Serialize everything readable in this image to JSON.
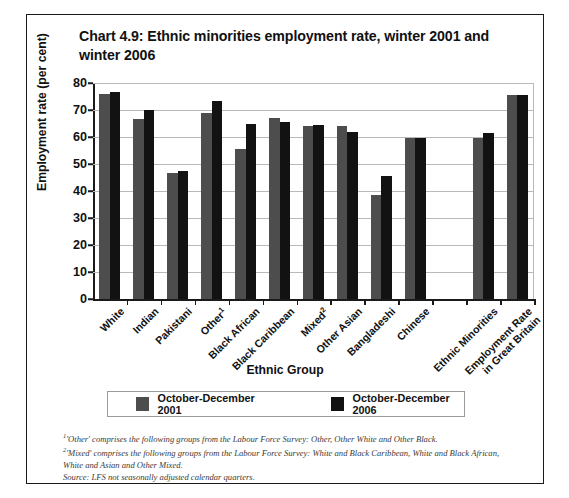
{
  "chart_data": {
    "type": "bar",
    "title": "Chart 4.9: Ethnic minorities employment rate, winter 2001 and winter 2006",
    "xlabel": "Ethnic Group",
    "ylabel": "Employment rate (per cent)",
    "ylim": [
      0,
      80
    ],
    "yticks": [
      0,
      10,
      20,
      30,
      40,
      50,
      60,
      70,
      80
    ],
    "ytick_labels": [
      "0",
      "10",
      "20",
      "30",
      "40",
      "50",
      "60",
      "70",
      "80"
    ],
    "grid": "horizontal",
    "legend_position": "below-plot",
    "categories": [
      "White",
      "Indian",
      "Pakistani",
      "Other¹",
      "Black African",
      "Black Caribbean",
      "Mixed²",
      "Other Asian",
      "Bangladeshi",
      "Chinese",
      "",
      "Ethnic Minorities",
      "Employment Rate in Great Britain"
    ],
    "series": [
      {
        "name": "October-December 2001",
        "color": "#4d4d4d",
        "values": [
          76.0,
          66.5,
          46.5,
          69.0,
          55.5,
          67.0,
          64.0,
          64.0,
          38.5,
          59.5,
          null,
          59.5,
          75.5
        ]
      },
      {
        "name": "October-December 2006",
        "color": "#121212",
        "values": [
          76.5,
          70.0,
          47.5,
          73.5,
          65.0,
          65.5,
          64.5,
          62.0,
          45.5,
          59.5,
          null,
          61.5,
          75.5
        ]
      }
    ]
  },
  "title": {
    "line1": "Chart 4.9: Ethnic minorities employment rate, winter 2001",
    "line2": "and winter 2006"
  },
  "axes": {
    "y_title": "Employment rate (per cent)",
    "x_title": "Ethnic Group"
  },
  "legend": {
    "items": [
      {
        "label": "October-December 2001",
        "color": "#4d4d4d"
      },
      {
        "label": "October-December 2006",
        "color": "#121212"
      }
    ]
  },
  "notes": {
    "note1_marker": "1",
    "note1": "'Other' comprises the following groups from the Labour Force Survey: Other, Other White and Other Black.",
    "note2_marker": "2",
    "note2": "'Mixed' comprises the following groups from the Labour Force Survey: White and Black Caribbean, White and Black African, White and Asian and Other Mixed.",
    "source": "Source: LFS not seasonally adjusted calendar quarters."
  }
}
